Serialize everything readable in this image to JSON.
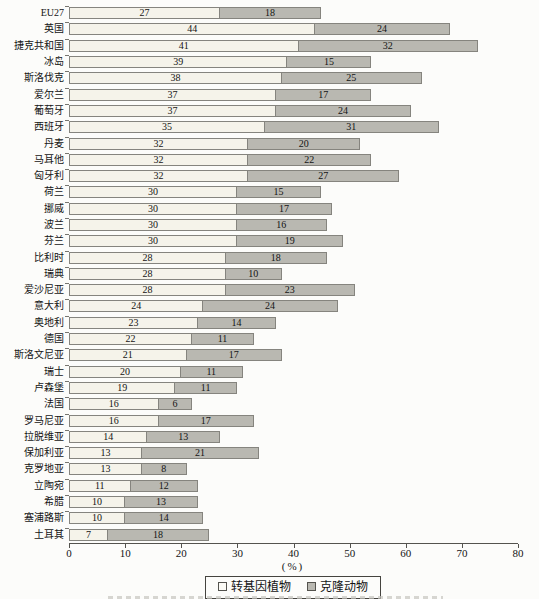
{
  "chart_data": {
    "type": "bar",
    "orientation": "horizontal",
    "stacked": true,
    "title": "",
    "xlabel": "(%)",
    "xlim": [
      0,
      80
    ],
    "xticks": [
      0,
      10,
      20,
      30,
      40,
      50,
      60,
      70,
      80
    ],
    "grid": false,
    "legend_position": "bottom",
    "value_labels": "inside",
    "categories": [
      "EU27",
      "英国",
      "捷克共和国",
      "冰岛",
      "斯洛伐克",
      "爱尔兰",
      "葡萄牙",
      "西班牙",
      "丹麦",
      "马耳他",
      "匈牙利",
      "荷兰",
      "挪威",
      "波兰",
      "芬兰",
      "比利时",
      "瑞典",
      "爱沙尼亚",
      "意大利",
      "奥地利",
      "德国",
      "斯洛文尼亚",
      "瑞士",
      "卢森堡",
      "法国",
      "罗马尼亚",
      "拉脱维亚",
      "保加利亚",
      "克罗地亚",
      "立陶宛",
      "希腊",
      "塞浦路斯",
      "土耳其"
    ],
    "series": [
      {
        "name": "转基因植物",
        "color": "#f5f3ea",
        "border_color": "#85847e",
        "values": [
          27,
          44,
          41,
          39,
          38,
          37,
          37,
          35,
          32,
          32,
          32,
          30,
          30,
          30,
          30,
          28,
          28,
          28,
          24,
          23,
          22,
          21,
          20,
          19,
          16,
          16,
          14,
          13,
          13,
          11,
          10,
          10,
          7
        ]
      },
      {
        "name": "克隆动物",
        "color": "#b9b8b1",
        "border_color": "#85847e",
        "values": [
          18,
          24,
          32,
          15,
          25,
          17,
          24,
          31,
          20,
          22,
          27,
          15,
          17,
          16,
          19,
          18,
          10,
          23,
          24,
          14,
          11,
          17,
          11,
          11,
          6,
          17,
          13,
          21,
          8,
          12,
          13,
          14,
          18
        ]
      }
    ]
  },
  "colors": {
    "background": "#fcfcfa",
    "axis": "#54534e",
    "text": "#141414"
  }
}
